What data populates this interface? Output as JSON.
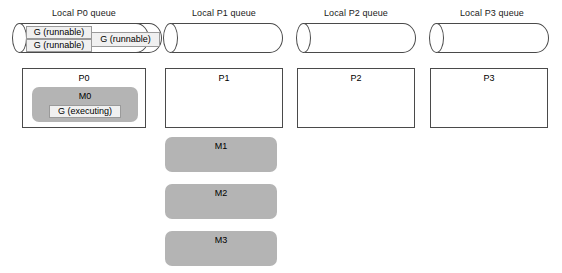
{
  "diagram": {
    "columns": [
      {
        "queue_label": "Local P0 queue",
        "processor_label": "P0"
      },
      {
        "queue_label": "Local P1 queue",
        "processor_label": "P1"
      },
      {
        "queue_label": "Local P2 queue",
        "processor_label": "P2"
      },
      {
        "queue_label": "Local P3 queue",
        "processor_label": "P3"
      }
    ],
    "p0_queue_items": [
      {
        "label": "G (runnable)"
      },
      {
        "label": "G (runnable)"
      },
      {
        "label": "G (runnable)"
      }
    ],
    "p0_machine": {
      "label": "M0",
      "goroutine_label": "G (executing)"
    },
    "idle_machines": [
      {
        "label": "M1"
      },
      {
        "label": "M2"
      },
      {
        "label": "M3"
      }
    ],
    "colors": {
      "background": "#ffffff",
      "outline": "#4a4a4a",
      "machine_fill": "#b4b4b4",
      "goroutine_fill": "#f0f0f0",
      "goroutine_border": "#9a9a9a",
      "text": "#000000"
    }
  }
}
